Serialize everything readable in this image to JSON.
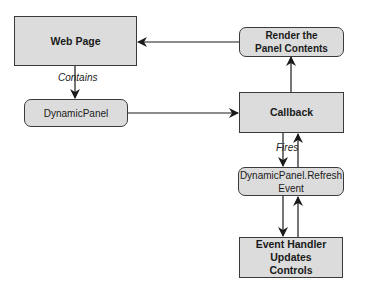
{
  "diagram": {
    "nodes": {
      "web_page": {
        "label": "Web Page",
        "shape": "rectangle"
      },
      "dynamic_panel": {
        "label": "DynamicPanel",
        "shape": "rounded"
      },
      "render_panel": {
        "label": "Render the Panel Contents",
        "shape": "rounded"
      },
      "callback": {
        "label": "Callback",
        "shape": "rectangle"
      },
      "refresh_event": {
        "label": "DynamicPanel.Refresh Event",
        "shape": "rounded"
      },
      "event_handler": {
        "label": "Event Handler Updates Controls",
        "shape": "rectangle"
      }
    },
    "edge_labels": {
      "contains": "Contains",
      "fires": "Fires"
    },
    "edges": [
      {
        "from": "web_page",
        "to": "dynamic_panel",
        "label": "Contains"
      },
      {
        "from": "dynamic_panel",
        "to": "callback"
      },
      {
        "from": "callback",
        "to": "render_panel"
      },
      {
        "from": "render_panel",
        "to": "web_page"
      },
      {
        "from": "callback",
        "to": "refresh_event",
        "label": "Fires"
      },
      {
        "from": "refresh_event",
        "to": "callback"
      },
      {
        "from": "refresh_event",
        "to": "event_handler"
      },
      {
        "from": "event_handler",
        "to": "refresh_event"
      }
    ],
    "colors": {
      "box_fill": "#dcdcdc",
      "stroke": "#1a1a1a"
    }
  }
}
